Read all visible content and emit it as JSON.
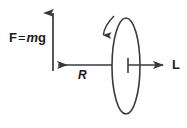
{
  "figure": {
    "background_color": "#ffffff",
    "stroke_color": "#3a3a3a",
    "text_color": "#1a1a1a"
  },
  "labels": {
    "force": {
      "vector_symbol": "F",
      "equals": "=",
      "mass_symbol": "m",
      "gravity_symbol": "g",
      "full_text": "F = mg"
    },
    "radius": {
      "symbol": "R"
    },
    "angular_momentum": {
      "symbol": "L"
    }
  },
  "elements": {
    "weight_arrow": {
      "name": "vertical-force-arrow",
      "direction": "up",
      "x": 53,
      "y_tail": 71,
      "y_head": 9
    },
    "radius_arrow": {
      "name": "radius-arrow",
      "direction": "left",
      "y": 65,
      "x_tail": 112,
      "x_head": 53
    },
    "angular_momentum_arrow": {
      "name": "angular-momentum-arrow",
      "direction": "right",
      "y": 65,
      "x_tail": 128,
      "x_head": 168
    },
    "center_tick": {
      "name": "ring-center-tick",
      "x": 128,
      "y_top": 58,
      "y_bottom": 73
    },
    "ring": {
      "name": "spinning-ring-ellipse",
      "center_x": 126,
      "center_y": 66,
      "radius_x": 14,
      "radius_y": 48
    },
    "spin_arrow": {
      "name": "spin-direction-curved-arrow",
      "start_x": 114,
      "start_y": 16,
      "end_x": 103,
      "end_y": 40,
      "direction": "down"
    }
  }
}
